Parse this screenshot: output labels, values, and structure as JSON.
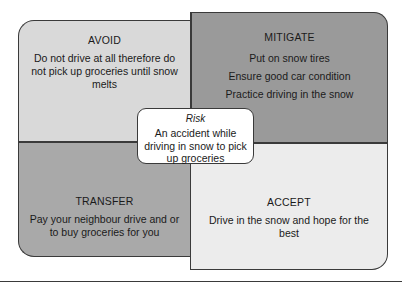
{
  "diagram": {
    "type": "risk-response-quadrant",
    "quadrants": {
      "avoid": {
        "title": "AVOID",
        "text": "Do not drive at all therefore do not pick up groceries until snow melts",
        "color": "#d9d9d9"
      },
      "mitigate": {
        "title": "MITIGATE",
        "lines": [
          "Put on snow tires",
          "Ensure good car condition",
          "Practice driving in the snow"
        ],
        "color": "#9a9a9a"
      },
      "transfer": {
        "title": "TRANSFER",
        "text": "Pay your neighbour drive and or to buy groceries for you",
        "color": "#a9a9a9"
      },
      "accept": {
        "title": "ACCEPT",
        "text": "Drive in the snow and hope for the best",
        "color": "#ececec"
      }
    },
    "center": {
      "title": "Risk",
      "text": "An accident while driving in snow to pick up groceries"
    }
  }
}
